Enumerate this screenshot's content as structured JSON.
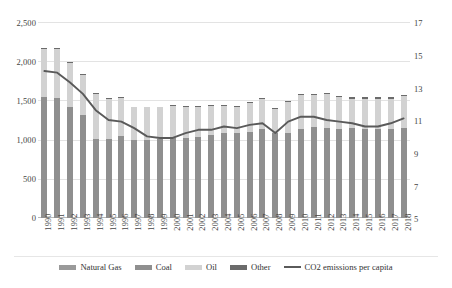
{
  "chart_data": {
    "type": "bar",
    "title": "",
    "subtitle": "",
    "xlabel": "",
    "ylabel": "",
    "y2label": "",
    "grid": true,
    "legend_position": "bottom",
    "categories": [
      "1990",
      "1991",
      "1992",
      "1993",
      "1994",
      "1995",
      "1996",
      "1997",
      "1998",
      "1999",
      "2000",
      "2001",
      "2002",
      "2003",
      "2004",
      "2005",
      "2006",
      "2007",
      "2008",
      "2009",
      "2010",
      "2011",
      "2012",
      "2013",
      "2014",
      "2015",
      "2016",
      "2017",
      "2018"
    ],
    "ylim": [
      0,
      2500
    ],
    "yticks": [
      "0",
      "500",
      "1,000",
      "1,500",
      "2,000",
      "2,500"
    ],
    "y2lim": [
      5,
      17
    ],
    "y2ticks": [
      "5",
      "7",
      "9",
      "11",
      "13",
      "15",
      "17"
    ],
    "series": [
      {
        "name": "Natural Gas",
        "color": "#9a9a9a",
        "stacked": true,
        "values": [
          0,
          0,
          0,
          0,
          0,
          0,
          0,
          0,
          0,
          0,
          0,
          0,
          0,
          0,
          0,
          0,
          0,
          0,
          0,
          0,
          0,
          0,
          0,
          0,
          0,
          0,
          0,
          0,
          0
        ]
      },
      {
        "name": "Coal",
        "color": "#8f8f8f",
        "stacked": true,
        "values": [
          1540,
          1535,
          1420,
          1320,
          1010,
          1010,
          1040,
          1000,
          990,
          1010,
          1020,
          1020,
          1030,
          1060,
          1080,
          1090,
          1100,
          1130,
          1090,
          1080,
          1130,
          1160,
          1150,
          1140,
          1150,
          1140,
          1130,
          1140,
          1150
        ]
      },
      {
        "name": "Oil",
        "color": "#d2d2d2",
        "stacked": true,
        "values": [
          620,
          625,
          555,
          505,
          575,
          505,
          490,
          410,
          420,
          400,
          410,
          400,
          390,
          370,
          350,
          330,
          370,
          390,
          300,
          400,
          440,
          410,
          430,
          400,
          370,
          380,
          390,
          380,
          400
        ]
      },
      {
        "name": "Other",
        "color": "#6b6b6b",
        "stacked": true,
        "values": [
          10,
          10,
          10,
          10,
          10,
          10,
          10,
          10,
          10,
          10,
          10,
          10,
          10,
          10,
          12,
          12,
          14,
          14,
          14,
          14,
          16,
          18,
          18,
          18,
          18,
          18,
          18,
          18,
          20
        ]
      },
      {
        "name": "CO2 emissions per capita",
        "color": "#5a5a5a",
        "type": "line",
        "axis": "secondary",
        "values": [
          14.0,
          13.9,
          13.3,
          12.6,
          11.6,
          11.0,
          10.9,
          10.5,
          10.0,
          9.9,
          9.9,
          10.2,
          10.4,
          10.4,
          10.6,
          10.5,
          10.7,
          10.8,
          10.2,
          10.9,
          11.2,
          11.2,
          11.0,
          10.9,
          10.8,
          10.6,
          10.6,
          10.8,
          11.1
        ]
      }
    ]
  },
  "legend": {
    "items": [
      {
        "label": "Natural Gas",
        "kind": "swatch",
        "color": "#9a9a9a"
      },
      {
        "label": "Coal",
        "kind": "swatch",
        "color": "#8f8f8f"
      },
      {
        "label": "Oil",
        "kind": "swatch",
        "color": "#d2d2d2"
      },
      {
        "label": "Other",
        "kind": "swatch",
        "color": "#6b6b6b"
      },
      {
        "label": "CO2 emissions per capita",
        "kind": "line",
        "color": "#5a5a5a"
      }
    ]
  }
}
